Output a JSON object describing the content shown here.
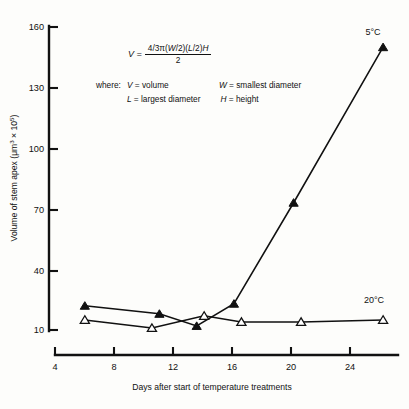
{
  "chart_data": {
    "type": "line",
    "title": "",
    "xlabel": "Days after start of temperature treatments",
    "ylabel": "Volume of stem apex (μm³ × 10⁵)",
    "xlim": [
      4,
      27
    ],
    "ylim": [
      10,
      160
    ],
    "xticks": [
      4,
      8,
      12,
      16,
      20,
      24
    ],
    "yticks": [
      10,
      40,
      70,
      100,
      130,
      160
    ],
    "grid": false,
    "legend_position": "inline-right-of-curve",
    "series": [
      {
        "name": "5°C",
        "marker": "filled-triangle",
        "x": [
          6,
          11,
          13.5,
          16,
          20,
          26
        ],
        "values": [
          22,
          18,
          12,
          23,
          73,
          150
        ]
      },
      {
        "name": "20°C",
        "marker": "open-triangle",
        "x": [
          6,
          10.5,
          14,
          16.5,
          20.5,
          26
        ],
        "values": [
          15,
          11,
          17,
          14,
          14,
          15
        ]
      }
    ],
    "annotations": {
      "equation": {
        "lhs": "V =",
        "numerator": "4/3π(W/2)(L/2)H",
        "denominator": "2"
      },
      "where_label": "where:",
      "definitions": [
        {
          "term": "V",
          "text": "= volume"
        },
        {
          "term": "W",
          "text": "= smallest diameter"
        },
        {
          "term": "L",
          "text": "= largest diameter"
        },
        {
          "term": "H",
          "text": "= height"
        }
      ]
    }
  },
  "axes": {
    "y_title": "Volume of stem apex (μm³ × 10⁵)",
    "x_title": "Days after start of temperature treatments",
    "y_ticklabels": [
      "160",
      "130",
      "100",
      "70",
      "40",
      "10"
    ],
    "x_ticklabels": [
      "4",
      "8",
      "12",
      "16",
      "20",
      "24"
    ]
  },
  "series_labels": {
    "cold": "5°C",
    "warm": "20°C"
  },
  "equation": {
    "lhs": "V =",
    "numerator_parts": {
      "a": "4/3π(",
      "w": "W",
      "b": "/2)(",
      "l": "L",
      "c": "/2)",
      "h": "H"
    },
    "denominator": "2"
  },
  "definitions": {
    "where": "where:",
    "v_term": "V",
    "v_text": "= volume",
    "w_term": "W",
    "w_text": "= smallest diameter",
    "l_term": "L",
    "l_text": "= largest diameter",
    "h_term": "H",
    "h_text": "= height"
  }
}
